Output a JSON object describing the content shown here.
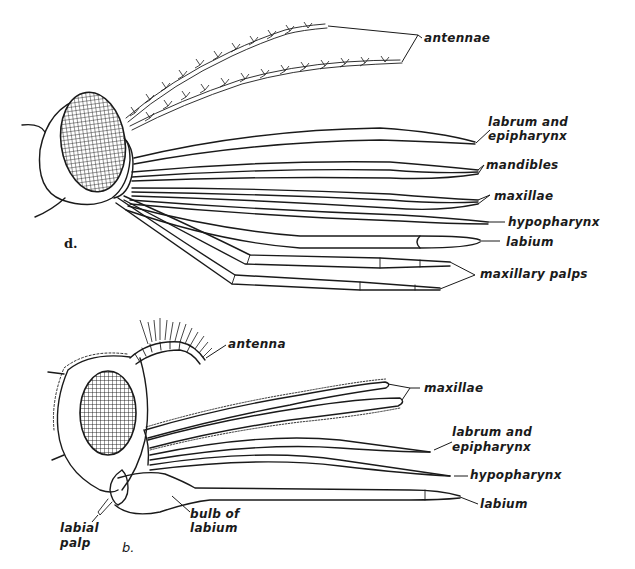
{
  "figure": {
    "panels": [
      {
        "id": "d",
        "letter": "d.",
        "labels": [
          "antennae",
          "labrum and epipharynx",
          "mandibles",
          "maxillae",
          "hypopharynx",
          "labium",
          "maxillary palps"
        ],
        "label_lines": {
          "antennae": "antennae",
          "labrum_line1": "labrum and",
          "labrum_line2": "epipharynx",
          "mandibles": "mandibles",
          "maxillae": "maxillae",
          "hypopharynx": "hypopharynx",
          "labium": "labium",
          "maxillary_palps": "maxillary palps"
        }
      },
      {
        "id": "b",
        "letter": "b.",
        "labels": [
          "antenna",
          "maxillae",
          "labrum and epipharynx",
          "hypopharynx",
          "labium",
          "bulb of labium",
          "labial palp"
        ],
        "label_lines": {
          "antenna": "antenna",
          "maxillae": "maxillae",
          "labrum_line1": "labrum and",
          "labrum_line2": "epipharynx",
          "hypopharynx": "hypopharynx",
          "labium": "labium",
          "bulb_line1": "bulb of",
          "bulb_line2": "labium",
          "labial_line1": "labial",
          "labial_line2": "palp"
        }
      }
    ]
  }
}
